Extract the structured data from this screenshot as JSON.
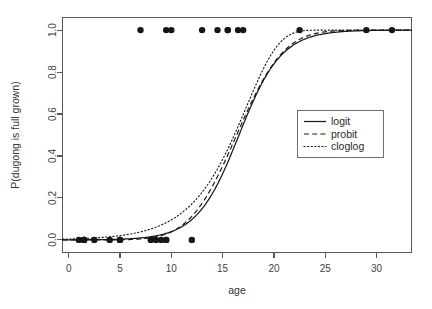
{
  "chart_data": {
    "type": "scatter",
    "title": "",
    "xlabel": "age",
    "ylabel": "P(dugong is full grown)",
    "xlim": [
      -0.6,
      33.4
    ],
    "ylim": [
      -0.06,
      1.06
    ],
    "grid": false,
    "legend_position": "center-right",
    "x_ticks": [
      0,
      5,
      10,
      15,
      20,
      25,
      30
    ],
    "x_tick_labels": [
      "0",
      "5",
      "10",
      "15",
      "20",
      "25",
      "30"
    ],
    "y_ticks": [
      0.0,
      0.2,
      0.4,
      0.6,
      0.8,
      1.0
    ],
    "y_tick_labels": [
      "0.0",
      "0.2",
      "0.4",
      "0.6",
      "0.8",
      "1.0"
    ],
    "points": [
      {
        "x": 1.0,
        "y": 0
      },
      {
        "x": 1.5,
        "y": 0
      },
      {
        "x": 1.5,
        "y": 0
      },
      {
        "x": 1.5,
        "y": 0
      },
      {
        "x": 2.5,
        "y": 0
      },
      {
        "x": 4.0,
        "y": 0
      },
      {
        "x": 5.0,
        "y": 0
      },
      {
        "x": 5.0,
        "y": 0
      },
      {
        "x": 7.0,
        "y": 1
      },
      {
        "x": 8.0,
        "y": 0
      },
      {
        "x": 8.5,
        "y": 0
      },
      {
        "x": 9.0,
        "y": 0
      },
      {
        "x": 9.5,
        "y": 0
      },
      {
        "x": 9.5,
        "y": 0
      },
      {
        "x": 9.5,
        "y": 1
      },
      {
        "x": 10.0,
        "y": 1
      },
      {
        "x": 12.0,
        "y": 0
      },
      {
        "x": 13.0,
        "y": 1
      },
      {
        "x": 14.5,
        "y": 1
      },
      {
        "x": 15.5,
        "y": 1
      },
      {
        "x": 15.5,
        "y": 1
      },
      {
        "x": 16.5,
        "y": 1
      },
      {
        "x": 17.0,
        "y": 1
      },
      {
        "x": 22.5,
        "y": 1
      },
      {
        "x": 29.0,
        "y": 1
      },
      {
        "x": 31.5,
        "y": 1
      }
    ],
    "series": [
      {
        "name": "logit",
        "style": "solid",
        "model": "logistic",
        "link": "logit",
        "intercept": -8.05,
        "slope": 0.485,
        "midpoint_x": 16.6
      },
      {
        "name": "probit",
        "style": "dashed",
        "model": "logistic",
        "link": "probit",
        "intercept": -4.55,
        "slope": 0.278,
        "midpoint_x": 16.35
      },
      {
        "name": "cloglog",
        "style": "dotted",
        "model": "logistic",
        "link": "cloglog",
        "intercept": -5.45,
        "slope": 0.315,
        "midpoint_x": 16.15
      }
    ],
    "legend_entries": [
      {
        "label": "logit",
        "style": "solid"
      },
      {
        "label": "probit",
        "style": "dashed"
      },
      {
        "label": "cloglog",
        "style": "dotted"
      }
    ]
  },
  "colors": {
    "background": "#ffffff",
    "axis": "#555a5e",
    "point": "#161616",
    "curve": "#1a1a1a",
    "text": "#2f3335"
  }
}
